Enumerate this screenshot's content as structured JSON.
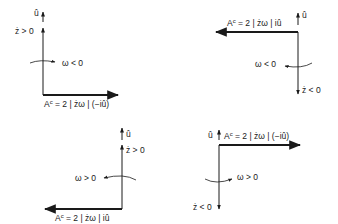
{
  "diagram": {
    "panels": [
      {
        "id": "top-left",
        "u_label": "û",
        "zdot_label": "ż > 0",
        "omega_label": "ω < 0",
        "force_prefix": "A",
        "force_sup": "c",
        "force_expr": " = 2 | żω | (−iû)"
      },
      {
        "id": "top-right",
        "u_label": "û",
        "zdot_label": "ż < 0",
        "omega_label": "ω < 0",
        "force_prefix": "A",
        "force_sup": "c",
        "force_expr": " = 2 | żω | iû"
      },
      {
        "id": "bottom-left",
        "u_label": "û",
        "zdot_label": "ż > 0",
        "omega_label": "ω > 0",
        "force_prefix": "A",
        "force_sup": "c",
        "force_expr": " = 2 | żω | iû"
      },
      {
        "id": "bottom-right",
        "u_label": "û",
        "zdot_label": "ż < 0",
        "omega_label": "ω > 0",
        "force_prefix": "A",
        "force_sup": "c",
        "force_expr": " = 2 | żω | (−iû)"
      }
    ],
    "colors": {
      "ink": "#1a1a1a",
      "background": "#ffffff"
    }
  }
}
